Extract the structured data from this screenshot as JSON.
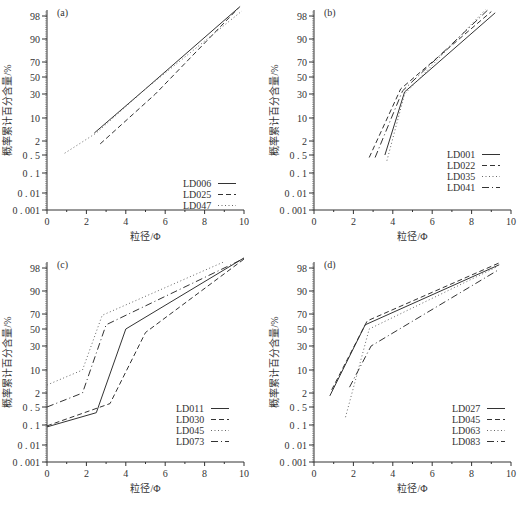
{
  "figure": {
    "ylabel": "概率累计百分含量/%",
    "xlabel": "粒径/Φ"
  },
  "chart_data": [
    {
      "type": "line",
      "panel": "(a)",
      "title": "(a)",
      "xlabel": "粒径/Φ",
      "ylabel": "概率累计百分含量/%",
      "xlim": [
        0,
        10
      ],
      "xticks": [
        0,
        2,
        4,
        6,
        8,
        10
      ],
      "yscale": "probability",
      "yticks": [
        "0.001",
        "0.01",
        "0.1",
        "0.5",
        "2",
        "10",
        "30",
        "50",
        "70",
        "90",
        "98"
      ],
      "grid": false,
      "legend_position": "lower right",
      "series": [
        {
          "name": "LD006",
          "style": "solid",
          "x": [
            2.4,
            5.0,
            9.8
          ],
          "y": [
            3.5,
            35,
            99.5
          ]
        },
        {
          "name": "LD025",
          "style": "dashed",
          "x": [
            2.7,
            5.5,
            9.7
          ],
          "y": [
            1.5,
            30,
            99.2
          ]
        },
        {
          "name": "LD047",
          "style": "dotted",
          "x": [
            0.9,
            2.5,
            5.0,
            9.9
          ],
          "y": [
            0.6,
            3.5,
            35,
            98.8
          ]
        }
      ]
    },
    {
      "type": "line",
      "panel": "(b)",
      "title": "(b)",
      "xlabel": "粒径/Φ",
      "ylabel": "概率累计百分含量/%",
      "xlim": [
        0,
        10
      ],
      "xticks": [
        0,
        2,
        4,
        6,
        8,
        10
      ],
      "yscale": "probability",
      "yticks": [
        "0.001",
        "0.01",
        "0.1",
        "0.5",
        "2",
        "10",
        "30",
        "50",
        "70",
        "90",
        "98"
      ],
      "grid": false,
      "legend_position": "lower right",
      "series": [
        {
          "name": "LD001",
          "style": "solid",
          "x": [
            3.6,
            4.6,
            9.2
          ],
          "y": [
            0.5,
            32,
            98.5
          ]
        },
        {
          "name": "LD022",
          "style": "dashed",
          "x": [
            2.8,
            4.4,
            9.0
          ],
          "y": [
            0.4,
            35,
            98.7
          ]
        },
        {
          "name": "LD035",
          "style": "dotted",
          "x": [
            3.7,
            4.6,
            8.7
          ],
          "y": [
            0.3,
            30,
            99.0
          ]
        },
        {
          "name": "LD041",
          "style": "dashdot",
          "x": [
            3.1,
            4.5,
            8.8
          ],
          "y": [
            0.4,
            33,
            98.9
          ]
        }
      ]
    },
    {
      "type": "line",
      "panel": "(c)",
      "title": "(c)",
      "xlabel": "粒径/Φ",
      "ylabel": "概率累计百分含量/%",
      "xlim": [
        0,
        10
      ],
      "xticks": [
        0,
        2,
        4,
        6,
        8,
        10
      ],
      "yscale": "probability",
      "yticks": [
        "0.001",
        "0.01",
        "0.1",
        "0.5",
        "2",
        "10",
        "30",
        "50",
        "70",
        "90",
        "98"
      ],
      "grid": false,
      "legend_position": "lower right",
      "series": [
        {
          "name": "LD011",
          "style": "solid",
          "x": [
            0,
            2.5,
            4.0,
            10.0
          ],
          "y": [
            0.08,
            0.3,
            50,
            99.6
          ]
        },
        {
          "name": "LD030",
          "style": "dashed",
          "x": [
            0,
            3.2,
            5.0,
            10.0
          ],
          "y": [
            0.09,
            0.7,
            45,
            99.4
          ]
        },
        {
          "name": "LD045",
          "style": "dotted",
          "x": [
            0,
            1.8,
            2.8,
            9.0
          ],
          "y": [
            3.5,
            10,
            68,
            99.0
          ]
        },
        {
          "name": "LD073",
          "style": "dashdot",
          "x": [
            0,
            1.8,
            3.0,
            10.0
          ],
          "y": [
            0.5,
            2,
            55,
            99.5
          ]
        }
      ]
    },
    {
      "type": "line",
      "panel": "(d)",
      "title": "(d)",
      "xlabel": "粒径/Φ",
      "ylabel": "概率累计百分含量/%",
      "xlim": [
        0,
        10
      ],
      "xticks": [
        0,
        2,
        4,
        6,
        8,
        10
      ],
      "yscale": "probability",
      "yticks": [
        "0.001",
        "0.01",
        "0.1",
        "0.5",
        "2",
        "10",
        "30",
        "50",
        "70",
        "90",
        "98"
      ],
      "grid": false,
      "legend_position": "lower right",
      "series": [
        {
          "name": "LD027",
          "style": "solid",
          "x": [
            0.8,
            2.6,
            9.4
          ],
          "y": [
            1.5,
            55,
            98.5
          ]
        },
        {
          "name": "LD045",
          "style": "dashed",
          "x": [
            0.9,
            2.7,
            9.4
          ],
          "y": [
            2.5,
            60,
            98.8
          ]
        },
        {
          "name": "LD063",
          "style": "dotted",
          "x": [
            1.6,
            2.8,
            9.3
          ],
          "y": [
            0.2,
            50,
            98.2
          ]
        },
        {
          "name": "LD083",
          "style": "dashdot",
          "x": [
            1.8,
            2.9,
            9.4
          ],
          "y": [
            3.0,
            30,
            97.5
          ]
        }
      ]
    }
  ]
}
